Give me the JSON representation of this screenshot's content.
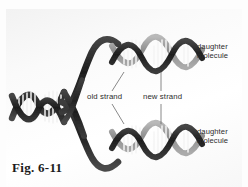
{
  "figure": {
    "caption": "Fig. 6-11",
    "title_alt": "DNA semiconservative replication diagram"
  },
  "labels": {
    "daughter_top": {
      "line1": "daughter",
      "line2": "molecule"
    },
    "daughter_bottom": {
      "line1": "daughter",
      "line2": "molecule"
    },
    "old_strand": "old strand",
    "new_strand": "new strand"
  },
  "colors": {
    "old_strand": "#2a2a2a",
    "new_strand": "#9a9a9a",
    "rung": "#f4f4f4",
    "background": "#fbfbfb",
    "label_text": "#2c2c2c",
    "leader_line": "#6b6b6b"
  },
  "diagram": {
    "type": "dna-replication",
    "parent_molecule": {
      "position": "left",
      "strand_count": 2,
      "strand_shade": "dark"
    },
    "replication_fork": {
      "position": "center"
    },
    "daughter_molecules": [
      {
        "position": "upper-right",
        "strands": [
          "old",
          "new"
        ]
      },
      {
        "position": "lower-right",
        "strands": [
          "old",
          "new"
        ]
      }
    ]
  }
}
